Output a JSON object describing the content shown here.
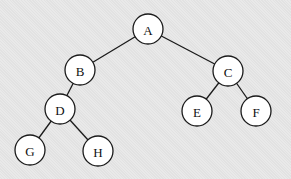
{
  "diagram": {
    "type": "binary-tree",
    "nodes": [
      {
        "id": "A",
        "label": "A",
        "x": 148,
        "y": 29
      },
      {
        "id": "B",
        "label": "B",
        "x": 80,
        "y": 70
      },
      {
        "id": "C",
        "label": "C",
        "x": 228,
        "y": 71
      },
      {
        "id": "D",
        "label": "D",
        "x": 60,
        "y": 109
      },
      {
        "id": "E",
        "label": "E",
        "x": 197,
        "y": 111
      },
      {
        "id": "F",
        "label": "F",
        "x": 256,
        "y": 111
      },
      {
        "id": "G",
        "label": "G",
        "x": 30,
        "y": 150
      },
      {
        "id": "H",
        "label": "H",
        "x": 98,
        "y": 151
      }
    ],
    "edges": [
      {
        "from": "A",
        "to": "B"
      },
      {
        "from": "A",
        "to": "C"
      },
      {
        "from": "B",
        "to": "D"
      },
      {
        "from": "C",
        "to": "E"
      },
      {
        "from": "C",
        "to": "F"
      },
      {
        "from": "D",
        "to": "G"
      },
      {
        "from": "D",
        "to": "H"
      }
    ],
    "node_radius": 15,
    "colors": {
      "background": "#e6e6e6",
      "node_fill": "#ffffff",
      "stroke": "#1a1a1a",
      "text": "#111111"
    }
  }
}
